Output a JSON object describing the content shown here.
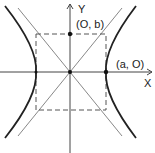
{
  "diagram": {
    "axes": {
      "x_label": "X",
      "y_label": "Y"
    },
    "points": [
      {
        "name": "origin",
        "label": ""
      },
      {
        "name": "co-vertex",
        "label": "(O, b)"
      },
      {
        "name": "vertex-right",
        "label": "(a, O)"
      },
      {
        "name": "vertex-left",
        "label": ""
      }
    ],
    "colors": {
      "curve": "#222222",
      "axis": "#444444",
      "asymptote": "#777777",
      "box": "#555555"
    }
  }
}
